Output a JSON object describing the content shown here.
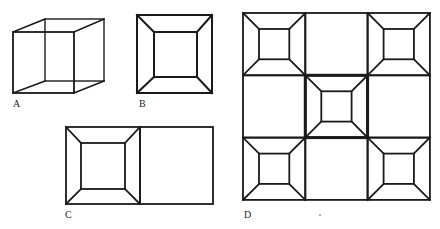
{
  "colors": {
    "ink": "#1a1a1a",
    "background": "#ffffff"
  },
  "figures": [
    {
      "id": "A",
      "label": "A",
      "kind": "necker-cube",
      "label_pos": [
        13,
        108
      ],
      "front": {
        "x": 13,
        "y": 32,
        "w": 61,
        "h": 61
      },
      "back": {
        "x": 45,
        "y": 19,
        "w": 59,
        "h": 62
      }
    },
    {
      "id": "B",
      "label": "B",
      "kind": "frustum-square",
      "label_pos": [
        139,
        108
      ],
      "outer": {
        "x": 137,
        "y": 15,
        "w": 75,
        "h": 78
      },
      "inner": {
        "x": 154,
        "y": 32,
        "w": 43,
        "h": 45
      }
    },
    {
      "id": "C",
      "label": "C",
      "kind": "frustum-with-adjacent-square",
      "label_pos": [
        65,
        219
      ],
      "outer": {
        "x": 66,
        "y": 127,
        "w": 74,
        "h": 77
      },
      "inner": {
        "x": 81,
        "y": 143,
        "w": 44,
        "h": 46
      },
      "adjacent": {
        "x": 140,
        "y": 127,
        "w": 73,
        "h": 77
      }
    },
    {
      "id": "D",
      "label": "D",
      "kind": "3x3-grid-of-frustums",
      "label_pos": [
        244,
        219
      ],
      "grid": {
        "x": 243,
        "y": 13,
        "cell": 62.3,
        "rows": 3,
        "cols": 3
      },
      "frustum_cells": [
        [
          0,
          0
        ],
        [
          0,
          2
        ],
        [
          1,
          1
        ],
        [
          2,
          0
        ],
        [
          2,
          2
        ]
      ],
      "highlight_cell": [
        1,
        1
      ],
      "inner_inset": 16,
      "dot": [
        319,
        214
      ]
    }
  ]
}
